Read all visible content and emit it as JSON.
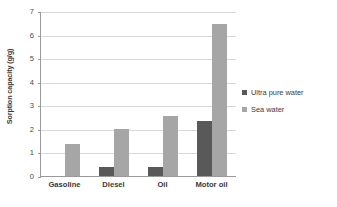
{
  "chart_data": {
    "type": "bar",
    "title": "",
    "subtitle": "",
    "xlabel": "",
    "ylabel": "Sorption capacity (g/g)",
    "categories": [
      "Gasoline",
      "Diesel",
      "Oil",
      "Motor oil"
    ],
    "series": [
      {
        "name": "Ultra pure water",
        "color": "#595959",
        "values": [
          0,
          0.37,
          0.38,
          2.35
        ]
      },
      {
        "name": "Sea water",
        "color": "#a6a6a6",
        "values": [
          1.35,
          2.0,
          2.55,
          6.45
        ]
      }
    ],
    "ylim": [
      0,
      7
    ],
    "ytick_values": [
      0,
      1,
      2,
      3,
      4,
      5,
      6,
      7
    ],
    "ytick_labels": [
      "0",
      "1",
      "2",
      "3",
      "4",
      "5",
      "6",
      "7"
    ],
    "grid": "horizontal",
    "legend_position": "right",
    "background_color": "#ffffff",
    "gridline_color": "#d9d9d9",
    "axis_color": "#9a9a9a"
  }
}
